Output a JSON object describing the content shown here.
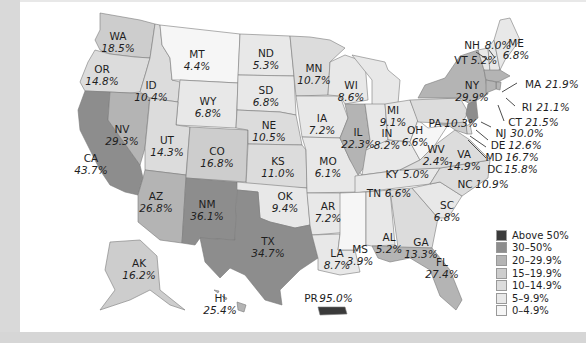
{
  "legend": {
    "items": [
      {
        "label": "Above 50%",
        "color": "#3a3a3a"
      },
      {
        "label": "30–50%",
        "color": "#8d8d8d"
      },
      {
        "label": "20–29.9%",
        "color": "#b4b4b4"
      },
      {
        "label": "15–19.9%",
        "color": "#cdcdcd"
      },
      {
        "label": "10–14.9%",
        "color": "#dcdcdc"
      },
      {
        "label": "5–9.9%",
        "color": "#e8e8e8"
      },
      {
        "label": "0–4.9%",
        "color": "#f6f6f6"
      }
    ]
  },
  "states": {
    "WA": {
      "abbr": "WA",
      "value": "18.5%"
    },
    "OR": {
      "abbr": "OR",
      "value": "14.8%"
    },
    "CA": {
      "abbr": "CA",
      "value": "43.7%"
    },
    "NV": {
      "abbr": "NV",
      "value": "29.3%"
    },
    "ID": {
      "abbr": "ID",
      "value": "10.4%"
    },
    "MT": {
      "abbr": "MT",
      "value": "4.4%"
    },
    "WY": {
      "abbr": "WY",
      "value": "6.8%"
    },
    "UT": {
      "abbr": "UT",
      "value": "14.3%"
    },
    "AZ": {
      "abbr": "AZ",
      "value": "26.8%"
    },
    "CO": {
      "abbr": "CO",
      "value": "16.8%"
    },
    "NM": {
      "abbr": "NM",
      "value": "36.1%"
    },
    "ND": {
      "abbr": "ND",
      "value": "5.3%"
    },
    "SD": {
      "abbr": "SD",
      "value": "6.8%"
    },
    "NE": {
      "abbr": "NE",
      "value": "10.5%"
    },
    "KS": {
      "abbr": "KS",
      "value": "11.0%"
    },
    "OK": {
      "abbr": "OK",
      "value": "9.4%"
    },
    "TX": {
      "abbr": "TX",
      "value": "34.7%"
    },
    "MN": {
      "abbr": "MN",
      "value": "10.7%"
    },
    "IA": {
      "abbr": "IA",
      "value": "7.2%"
    },
    "MO": {
      "abbr": "MO",
      "value": "6.1%"
    },
    "AR": {
      "abbr": "AR",
      "value": "7.2%"
    },
    "LA": {
      "abbr": "LA",
      "value": "8.7%"
    },
    "WI": {
      "abbr": "WI",
      "value": "8.6%"
    },
    "IL": {
      "abbr": "IL",
      "value": "22.3%"
    },
    "MI": {
      "abbr": "MI",
      "value": "9.1%"
    },
    "IN": {
      "abbr": "IN",
      "value": "8.2%"
    },
    "OH": {
      "abbr": "OH",
      "value": "6.6%"
    },
    "KY": {
      "abbr": "KY",
      "value": "5.0%"
    },
    "TN": {
      "abbr": "TN",
      "value": "6.6%"
    },
    "MS": {
      "abbr": "MS",
      "value": "3.9%"
    },
    "AL": {
      "abbr": "AL",
      "value": "5.2%"
    },
    "GA": {
      "abbr": "GA",
      "value": "13.3%"
    },
    "FL": {
      "abbr": "FL",
      "value": "27.4%"
    },
    "SC": {
      "abbr": "SC",
      "value": "6.8%"
    },
    "NC": {
      "abbr": "NC",
      "value": "10.9%"
    },
    "VA": {
      "abbr": "VA",
      "value": "14.9%"
    },
    "WV": {
      "abbr": "WV",
      "value": "2.4%"
    },
    "PA": {
      "abbr": "PA",
      "value": "10.3%"
    },
    "NY": {
      "abbr": "NY",
      "value": "29.9%"
    },
    "VT": {
      "abbr": "VT",
      "value": "5.2%"
    },
    "NH": {
      "abbr": "NH",
      "value": "8.0%"
    },
    "ME": {
      "abbr": "ME",
      "value": "6.8%"
    },
    "MA": {
      "abbr": "MA",
      "value": "21.9%"
    },
    "RI": {
      "abbr": "RI",
      "value": "21.1%"
    },
    "CT": {
      "abbr": "CT",
      "value": "21.5%"
    },
    "NJ": {
      "abbr": "NJ",
      "value": "30.0%"
    },
    "DE": {
      "abbr": "DE",
      "value": "12.6%"
    },
    "MD": {
      "abbr": "MD",
      "value": "16.7%"
    },
    "DC": {
      "abbr": "DC",
      "value": "15.8%"
    },
    "AK": {
      "abbr": "AK",
      "value": "16.2%"
    },
    "HI": {
      "abbr": "HI",
      "value": "25.4%"
    },
    "PR": {
      "abbr": "PR",
      "value": "95.0%"
    }
  }
}
